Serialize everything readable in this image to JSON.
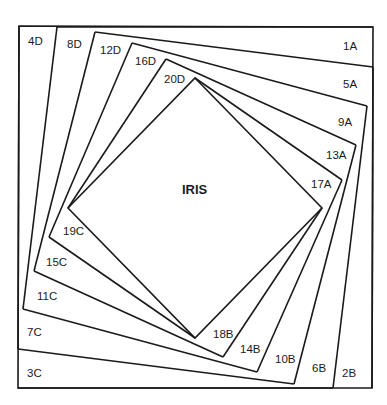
{
  "diagram": {
    "center_label": "IRIS",
    "outer_square": [
      [
        19,
        26
      ],
      [
        373,
        27
      ],
      [
        372,
        388
      ],
      [
        18,
        388
      ]
    ],
    "rings": {
      "top": [
        [
          57,
          27
        ],
        [
          95,
          32
        ],
        [
          132,
          43
        ],
        [
          166,
          59
        ],
        [
          195,
          78
        ]
      ],
      "right": [
        [
          373,
          67
        ],
        [
          367,
          106
        ],
        [
          356,
          145
        ],
        [
          342,
          180
        ],
        [
          322,
          208
        ]
      ],
      "bottom": [
        [
          333,
          388
        ],
        [
          294,
          384
        ],
        [
          257,
          372
        ],
        [
          223,
          357
        ],
        [
          195,
          338
        ]
      ],
      "left": [
        [
          18,
          349
        ],
        [
          23,
          309
        ],
        [
          34,
          271
        ],
        [
          49,
          237
        ],
        [
          68,
          208
        ]
      ]
    },
    "labels": {
      "A": [
        {
          "text": "1A",
          "x": 343,
          "y": 50
        },
        {
          "text": "5A",
          "x": 343,
          "y": 88
        },
        {
          "text": "9A",
          "x": 338,
          "y": 126
        },
        {
          "text": "13A",
          "x": 326,
          "y": 159
        },
        {
          "text": "17A",
          "x": 311,
          "y": 188
        }
      ],
      "B": [
        {
          "text": "2B",
          "x": 342,
          "y": 377
        },
        {
          "text": "6B",
          "x": 312,
          "y": 372
        },
        {
          "text": "10B",
          "x": 275,
          "y": 363
        },
        {
          "text": "14B",
          "x": 240,
          "y": 353
        },
        {
          "text": "18B",
          "x": 213,
          "y": 338
        }
      ],
      "C": [
        {
          "text": "3C",
          "x": 27,
          "y": 377
        },
        {
          "text": "7C",
          "x": 27,
          "y": 336
        },
        {
          "text": "11C",
          "x": 37,
          "y": 300
        },
        {
          "text": "15C",
          "x": 46,
          "y": 266
        },
        {
          "text": "19C",
          "x": 63,
          "y": 235
        }
      ],
      "D": [
        {
          "text": "4D",
          "x": 28,
          "y": 45
        },
        {
          "text": "8D",
          "x": 67,
          "y": 48
        },
        {
          "text": "12D",
          "x": 100,
          "y": 54
        },
        {
          "text": "16D",
          "x": 135,
          "y": 65
        },
        {
          "text": "20D",
          "x": 164,
          "y": 83
        }
      ]
    }
  }
}
